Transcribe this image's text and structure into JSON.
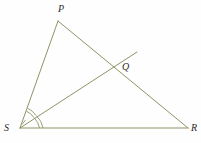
{
  "figure": {
    "kind": "geometry-diagram",
    "background_color": "#fefefe",
    "stroke_color": "#8f9466",
    "label_color": "#2b2b2b",
    "stroke_width": 1
  },
  "points": {
    "P": {
      "label": "P",
      "x": 58,
      "y": 21
    },
    "Q": {
      "label": "Q",
      "x": 118,
      "y": 61
    },
    "R": {
      "label": "R",
      "x": 188,
      "y": 128
    },
    "S": {
      "label": "S",
      "x": 20,
      "y": 128
    }
  },
  "segments": [
    {
      "name": "segment-SP",
      "from": "S",
      "to": "P"
    },
    {
      "name": "segment-PR",
      "from": "P",
      "to": "R"
    },
    {
      "name": "segment-SR",
      "from": "S",
      "to": "R"
    },
    {
      "name": "ray-SQ",
      "from": "S",
      "to": "Q",
      "extends_beyond": true,
      "extend_to_x": 137,
      "extend_to_y": 52
    }
  ],
  "angle_marks": [
    {
      "name": "angle-PSQ",
      "vertex": "S",
      "arcs": 1,
      "radius": 18
    },
    {
      "name": "angle-QSR",
      "vertex": "S",
      "arcs": 2,
      "radius": 22
    }
  ],
  "labels": {
    "P": "P",
    "Q": "Q",
    "R": "R",
    "S": "S"
  }
}
